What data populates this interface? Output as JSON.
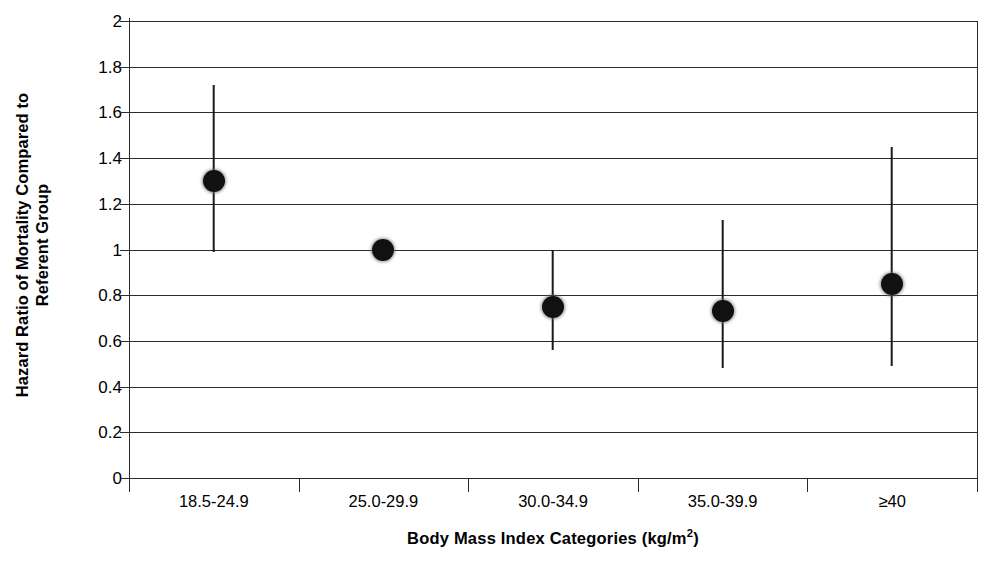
{
  "chart_data": {
    "type": "scatter",
    "plot_style": "forest-plot-with-error-bars",
    "title": "",
    "xlabel": "Body Mass Index Categories (kg/m2)",
    "xlabel_main": "Body Mass Index Categories (kg/m",
    "xlabel_sup": "2",
    "xlabel_tail": ")",
    "ylabel_line1": "Hazard Ratio of Mortality Compared to",
    "ylabel_line2": "Referent Group",
    "categories": [
      "18.5-24.9",
      "25.0-29.9",
      "30.0-34.9",
      "35.0-39.9",
      "≥40"
    ],
    "values": [
      1.3,
      1.0,
      0.75,
      0.73,
      0.85
    ],
    "ci_lower": [
      0.99,
      null,
      0.56,
      0.48,
      0.49
    ],
    "ci_upper": [
      1.72,
      null,
      1.0,
      1.13,
      1.45
    ],
    "referent_index": 1,
    "ylim": [
      0,
      2
    ],
    "yticks": [
      0,
      0.2,
      0.4,
      0.6,
      0.8,
      1,
      1.2,
      1.4,
      1.6,
      1.8,
      2
    ],
    "ytick_labels": [
      "0",
      "0.2",
      "0.4",
      "0.6",
      "0.8",
      "1",
      "1.2",
      "1.4",
      "1.6",
      "1.8",
      "2"
    ],
    "grid": true,
    "grid_axis": "y",
    "legend": null,
    "marker_color": "#111111",
    "line_color": "#2b2b2b",
    "background": "#ffffff"
  }
}
